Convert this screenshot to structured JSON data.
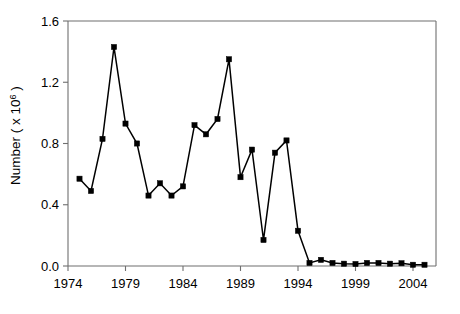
{
  "chart_data": {
    "type": "line",
    "title": "",
    "xlabel": "",
    "ylabel": "Number ( x 10",
    "ylabel_exponent": "6",
    "ylabel_close": " )",
    "xlim": [
      1974,
      2006
    ],
    "ylim": [
      0.0,
      1.6
    ],
    "grid": false,
    "legend": null,
    "x_tick_labels": [
      "1974",
      "1979",
      "1984",
      "1989",
      "1994",
      "1999",
      "2004"
    ],
    "x_tick_values": [
      1974,
      1979,
      1984,
      1989,
      1994,
      1999,
      2004
    ],
    "y_tick_labels": [
      "0.0",
      "0.4",
      "0.8",
      "1.2",
      "1.6"
    ],
    "y_tick_values": [
      0.0,
      0.4,
      0.8,
      1.2,
      1.6
    ],
    "marker": "square",
    "marker_color": "#000000",
    "line_color": "#000000",
    "x": [
      1975,
      1976,
      1977,
      1978,
      1979,
      1980,
      1981,
      1982,
      1983,
      1984,
      1985,
      1986,
      1987,
      1988,
      1989,
      1990,
      1991,
      1992,
      1993,
      1994,
      1995,
      1996,
      1997,
      1998,
      1999,
      2000,
      2001,
      2002,
      2003,
      2004,
      2005
    ],
    "values": [
      0.57,
      0.49,
      0.83,
      1.43,
      0.93,
      0.8,
      0.46,
      0.54,
      0.46,
      0.52,
      0.92,
      0.86,
      0.96,
      1.35,
      0.58,
      0.76,
      0.17,
      0.74,
      0.82,
      0.23,
      0.02,
      0.04,
      0.02,
      0.015,
      0.013,
      0.02,
      0.02,
      0.015,
      0.018,
      0.008,
      0.008
    ]
  }
}
